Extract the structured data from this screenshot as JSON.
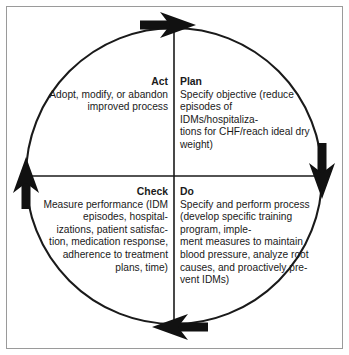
{
  "diagram": {
    "type": "pdca-cycle",
    "direction": "clockwise",
    "colors": {
      "stroke": "#1a1a1a",
      "arrow": "#111111",
      "text": "#1a1a1a",
      "background": "#ffffff",
      "border": "#9a9a9a"
    },
    "quadrants": [
      {
        "id": "act",
        "heading": "Act",
        "body": "Adopt, modify, or abandon improved process",
        "align": "right"
      },
      {
        "id": "plan",
        "heading": "Plan",
        "body": "Specify objective (reduce episodes of IDMs/hospitaliza-\ntions for CHF/reach ideal dry weight)",
        "align": "left"
      },
      {
        "id": "check",
        "heading": "Check",
        "body": "Measure performance (IDM episodes, hospital-\nizations, patient satisfac-\ntion, medication response, adherence to treatment plans, time)",
        "align": "right"
      },
      {
        "id": "do",
        "heading": "Do",
        "body": "Specify and perform process (develop specific training program, imple-\nment measures to maintain blood pressure, analyze root causes, and proactively pre-\nvent IDMs)",
        "align": "left"
      }
    ],
    "arrows": [
      {
        "id": "top",
        "points": "right"
      },
      {
        "id": "right",
        "points": "down"
      },
      {
        "id": "bottom",
        "points": "left"
      },
      {
        "id": "left",
        "points": "up"
      }
    ]
  }
}
